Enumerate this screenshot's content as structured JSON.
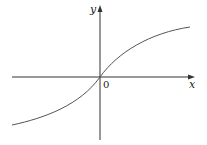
{
  "diagram": {
    "type": "function-graph",
    "labels": {
      "x_axis": "x",
      "y_axis": "y",
      "origin": "0"
    },
    "colors": {
      "axes": "#333333",
      "curve": "#555555"
    },
    "curve_shape": "increasing odd function through origin, concave up for x<0 and concave down for x>0 (arctan-like)"
  }
}
